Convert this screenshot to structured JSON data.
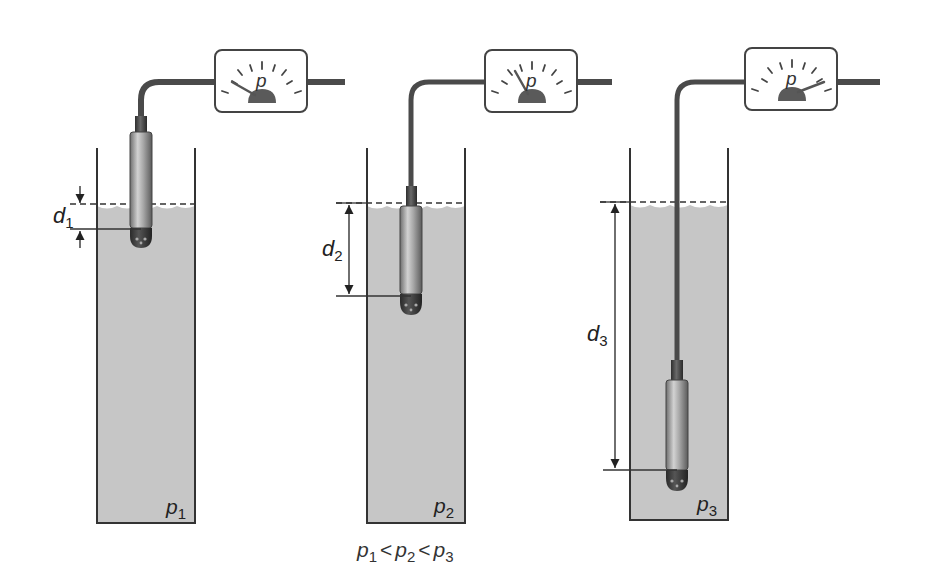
{
  "diagram": {
    "colors": {
      "liquid": "#c4c4c4",
      "outline": "#333333",
      "cable": "#4a4a4a",
      "sensor_body": "#9a9a9a",
      "sensor_tip": "#3a3a3a",
      "gauge_face": "#ffffff",
      "gauge_needle": "#555555"
    },
    "setups": [
      {
        "id": 1,
        "depth_label": {
          "symbol": "d",
          "sub": "1"
        },
        "pressure_label": {
          "symbol": "p",
          "sub": "1"
        },
        "gauge_label": "p",
        "needle": "low"
      },
      {
        "id": 2,
        "depth_label": {
          "symbol": "d",
          "sub": "2"
        },
        "pressure_label": {
          "symbol": "p",
          "sub": "2"
        },
        "gauge_label": "p",
        "needle": "medium"
      },
      {
        "id": 3,
        "depth_label": {
          "symbol": "d",
          "sub": "3"
        },
        "pressure_label": {
          "symbol": "p",
          "sub": "3"
        },
        "gauge_label": "p",
        "needle": "high"
      }
    ],
    "caption": {
      "p1": "p",
      "s1": "1",
      "op1": "<",
      "p2": "p",
      "s2": "2",
      "op2": "<",
      "p3": "p",
      "s3": "3"
    }
  }
}
